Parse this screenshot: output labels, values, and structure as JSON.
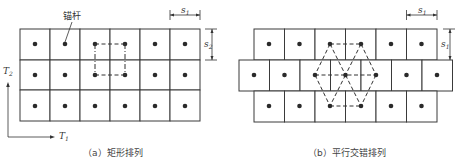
{
  "figure_a": {
    "caption": "（a）矩形排列",
    "anchor_label": "锚杆",
    "dim_horizontal": "s",
    "dim_horizontal_sub": "1",
    "dim_vertical": "s",
    "dim_vertical_sub": "2",
    "axis_x": "T",
    "axis_x_sub": "1",
    "axis_y": "T",
    "axis_y_sub": "2",
    "grid": {
      "rows": 3,
      "cols": 6
    }
  },
  "figure_b": {
    "caption": "（b）平行交错排列",
    "dim_horizontal": "s",
    "dim_horizontal_sub": "1",
    "dim_vertical": "s",
    "dim_vertical_sub": "1",
    "grid": {
      "rows": [
        6,
        7,
        6
      ],
      "offset": "half-cell stagger on middle row"
    }
  },
  "colors": {
    "line": "#3a3a3a",
    "dot": "#2a2a2a",
    "background": "#ffffff"
  }
}
